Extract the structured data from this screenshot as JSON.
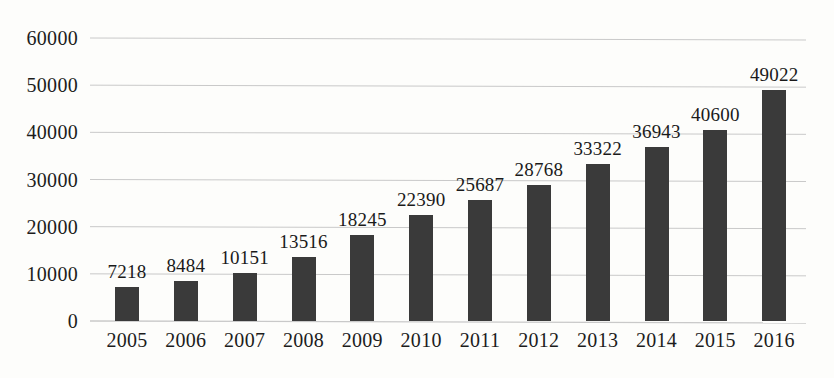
{
  "chart_data": {
    "type": "bar",
    "title": "",
    "subtitle": "",
    "xlabel": "",
    "ylabel": "",
    "categories": [
      "2005",
      "2006",
      "2007",
      "2008",
      "2009",
      "2010",
      "2011",
      "2012",
      "2013",
      "2014",
      "2015",
      "2016"
    ],
    "values": [
      7218,
      8484,
      10151,
      13516,
      18245,
      22390,
      25687,
      28768,
      33322,
      36943,
      40600,
      49022
    ],
    "data_labels": [
      "7218",
      "8484",
      "10151",
      "13516",
      "18245",
      "22390",
      "25687",
      "28768",
      "33322",
      "36943",
      "40600",
      "49022"
    ],
    "ylim": [
      0,
      60000
    ],
    "y_ticks": [
      0,
      10000,
      20000,
      30000,
      40000,
      50000,
      60000
    ],
    "y_tick_labels": [
      "0",
      "10000",
      "20000",
      "30000",
      "40000",
      "50000",
      "60000"
    ],
    "grid": true,
    "grid_axis": "y",
    "legend": false,
    "legend_position": "none",
    "series": [
      {
        "name": "",
        "values": [
          7218,
          8484,
          10151,
          13516,
          18245,
          22390,
          25687,
          28768,
          33322,
          36943,
          40600,
          49022
        ]
      }
    ]
  },
  "style": {
    "bar_color": "#3a3a3a",
    "grid_color": "#c9c9c9",
    "text_color": "#1c1c1c",
    "background": "#fdfdfb"
  }
}
